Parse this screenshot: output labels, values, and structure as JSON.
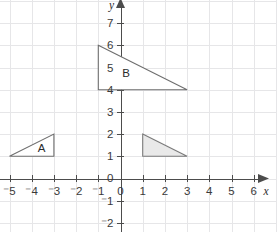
{
  "chart_data": {
    "type": "scatter",
    "title": "",
    "xlabel": "x",
    "ylabel": "y",
    "grid": true,
    "legend": false,
    "xlim": [
      -5.7,
      6.9
    ],
    "ylim": [
      -2.7,
      7.6
    ],
    "x_ticks": [
      -5,
      -4,
      -3,
      -2,
      -1,
      0,
      1,
      2,
      3,
      4,
      5,
      6
    ],
    "y_ticks": [
      -2,
      -1,
      0,
      1,
      2,
      3,
      4,
      5,
      6,
      7
    ],
    "x_tick_labels": [
      "⁻5",
      "⁻4",
      "⁻3",
      "⁻2",
      "⁻1",
      "0",
      "1",
      "2",
      "3",
      "4",
      "5",
      "6"
    ],
    "y_tick_labels": [
      "⁻2",
      "⁻1",
      "0",
      "1",
      "2",
      "3",
      "4",
      "5",
      "6",
      "7"
    ],
    "grid_step": 1,
    "shapes": [
      {
        "name": "triangle-a",
        "label": "A",
        "label_position": [
          -3.55,
          1.38
        ],
        "fill": "none",
        "stroke": "#6e6e6e",
        "vertices": [
          [
            -5,
            1
          ],
          [
            -3,
            2
          ],
          [
            -3,
            1
          ]
        ]
      },
      {
        "name": "triangle-b",
        "label": "B",
        "label_position": [
          0.25,
          4.75
        ],
        "fill": "none",
        "stroke": "#6e6e6e",
        "vertices": [
          [
            -1,
            6
          ],
          [
            3,
            4
          ],
          [
            -1,
            4
          ]
        ]
      },
      {
        "name": "triangle-image",
        "label": "",
        "label_position": null,
        "fill": "#e9e9e9",
        "stroke": "#7a7a7a",
        "vertices": [
          [
            1,
            2
          ],
          [
            3,
            1
          ],
          [
            1,
            1
          ]
        ]
      }
    ]
  },
  "axes": {
    "x_axis_label": "x",
    "y_axis_label": "y",
    "origin_label": "0"
  },
  "colors": {
    "grid": "#e6e6e8",
    "axis": "#4c4c4c",
    "shape_fill": "#e9e9e9",
    "shape_stroke": "#6e6e6e",
    "text": "#3a3a3a",
    "background": "#ffffff"
  }
}
